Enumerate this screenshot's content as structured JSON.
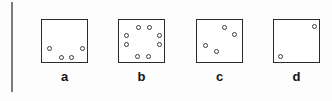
{
  "figure": {
    "width": 332,
    "height": 101,
    "background_color": "#fdfdfd",
    "box_border_color": "#2b2b2b",
    "dot_border_color": "#3a3a3a",
    "dot_fill_color": "#ffffff",
    "label_color": "#141414",
    "margin_rule": {
      "color": "#7b7b7b",
      "x": 11,
      "y": 2,
      "width": 2,
      "height": 90
    },
    "dot_diameter": 5,
    "label_font_size": 13,
    "panels": [
      {
        "label": "a",
        "dot_count": 4,
        "box": {
          "x": 41,
          "y": 19,
          "width": 47,
          "height": 44
        },
        "label_pos": {
          "x": 41,
          "y": 70,
          "width": 47
        },
        "dots": [
          {
            "cx": 7,
            "cy": 28
          },
          {
            "cx": 40,
            "cy": 28
          },
          {
            "cx": 19,
            "cy": 37
          },
          {
            "cx": 29,
            "cy": 37
          }
        ]
      },
      {
        "label": "b",
        "dot_count": 8,
        "box": {
          "x": 118,
          "y": 19,
          "width": 47,
          "height": 44
        },
        "label_pos": {
          "x": 118,
          "y": 70,
          "width": 47
        },
        "dots": [
          {
            "cx": 19,
            "cy": 7
          },
          {
            "cx": 30,
            "cy": 7
          },
          {
            "cx": 7,
            "cy": 15
          },
          {
            "cx": 40,
            "cy": 15
          },
          {
            "cx": 7,
            "cy": 24
          },
          {
            "cx": 40,
            "cy": 24
          },
          {
            "cx": 18,
            "cy": 36
          },
          {
            "cx": 29,
            "cy": 36
          }
        ]
      },
      {
        "label": "c",
        "dot_count": 4,
        "box": {
          "x": 196,
          "y": 19,
          "width": 47,
          "height": 44
        },
        "label_pos": {
          "x": 196,
          "y": 70,
          "width": 47
        },
        "dots": [
          {
            "cx": 27,
            "cy": 7
          },
          {
            "cx": 37,
            "cy": 14
          },
          {
            "cx": 8,
            "cy": 25
          },
          {
            "cx": 19,
            "cy": 31
          }
        ]
      },
      {
        "label": "d",
        "dot_count": 2,
        "box": {
          "x": 273,
          "y": 19,
          "width": 47,
          "height": 44
        },
        "label_pos": {
          "x": 273,
          "y": 70,
          "width": 47
        },
        "dots": [
          {
            "cx": 40,
            "cy": 6
          },
          {
            "cx": 6,
            "cy": 36
          }
        ]
      }
    ]
  }
}
